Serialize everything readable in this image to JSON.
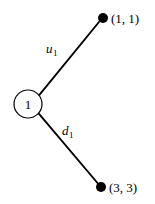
{
  "diagram": {
    "type": "tree",
    "background_color": "#ffffff",
    "stroke_color": "#000000",
    "root": {
      "label": "1",
      "shape": "circle",
      "cx": 28,
      "cy": 104,
      "r": 14
    },
    "edges": [
      {
        "id": "up-edge",
        "label": "u",
        "subscript": "1",
        "label_x": 46,
        "label_y": 53,
        "x1": 39.2,
        "y1": 95.2,
        "x2": 99,
        "y2": 22
      },
      {
        "id": "down-edge",
        "label": "d",
        "subscript": "1",
        "label_x": 62,
        "label_y": 135,
        "x1": 38.6,
        "y1": 113.4,
        "x2": 97.5,
        "y2": 183
      }
    ],
    "terminal_nodes": [
      {
        "id": "up-node",
        "label": "(1, 1)",
        "cx": 103,
        "cy": 18,
        "r": 5,
        "label_x": 111,
        "label_y": 23
      },
      {
        "id": "down-node",
        "label": "(3, 3)",
        "cx": 101,
        "cy": 187,
        "r": 5,
        "label_x": 109,
        "label_y": 192
      }
    ]
  }
}
